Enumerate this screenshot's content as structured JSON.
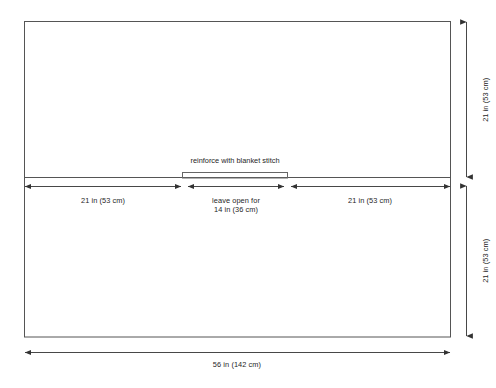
{
  "diagram": {
    "title_note": "reinforce with blanket stitch",
    "panel": {
      "top_section_label": "21 in (53 cm)",
      "bottom_section_label": "21 in (53 cm)"
    },
    "horizontal_dimensions": [
      {
        "name": "left-segment",
        "label": "21 in (53 cm)"
      },
      {
        "name": "center-segment",
        "label_line1": "leave open for",
        "label_line2": "14 in (36 cm)"
      },
      {
        "name": "right-segment",
        "label": "21 in (53 cm)"
      }
    ],
    "overall_width_label": "56 in (142 cm)",
    "colors": {
      "background": "#ffffff",
      "outline": "#4d4d4d",
      "dimension_line": "#404040",
      "text": "#262626"
    }
  }
}
